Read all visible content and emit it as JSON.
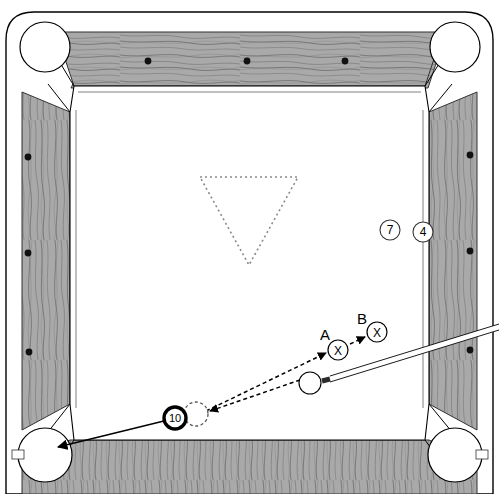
{
  "diagram": {
    "type": "pool-table-shot-diagram",
    "canvas": {
      "width": 499,
      "height": 494
    },
    "colors": {
      "cloth": "#ffffff",
      "rail_wood": "#a8a8a8",
      "rail_grain": "#5d5d5d",
      "outline": "#000000",
      "diamond": "#111111",
      "rack_outline": "#8a8a8a",
      "aim_line": "#111111",
      "cue_stick": "#ffffff",
      "cue_tip": "#2b2b2b"
    },
    "table": {
      "playfield": {
        "left": 52,
        "top": 33,
        "right": 446,
        "bottom": 470
      },
      "rail_width": 40,
      "diamonds": {
        "top": [
          148,
          247,
          345
        ],
        "left": [
          157,
          253,
          352
        ],
        "right": [
          155,
          251,
          350
        ],
        "count_per_rail": 3
      },
      "pockets": [
        {
          "name": "top-left",
          "cx": 45,
          "cy": 47,
          "r": 25
        },
        {
          "name": "top-right",
          "cx": 455,
          "cy": 47,
          "r": 25
        },
        {
          "name": "bottom-left",
          "cx": 45,
          "cy": 455,
          "r": 27
        },
        {
          "name": "bottom-right",
          "cx": 455,
          "cy": 455,
          "r": 27
        }
      ]
    },
    "rack": {
      "label": "rack-outline-triangle",
      "style": "dotted",
      "points": "200,177 298,177 249,265"
    },
    "balls": [
      {
        "id": "ball-7",
        "label": "7",
        "cx": 390,
        "cy": 230,
        "r": 10,
        "style": "thin-outline"
      },
      {
        "id": "ball-4",
        "label": "4",
        "cx": 423,
        "cy": 232,
        "r": 10,
        "style": "thin-outline"
      },
      {
        "id": "ball-10",
        "label": "10",
        "cx": 175,
        "cy": 418,
        "r": 11,
        "style": "thick-ring"
      },
      {
        "id": "cue-ball",
        "label": "",
        "cx": 310,
        "cy": 383,
        "r": 11,
        "style": "thin-outline"
      }
    ],
    "ghost_ball": {
      "id": "ghost-ball",
      "cx": 196,
      "cy": 414,
      "r": 12,
      "style": "dashed"
    },
    "targets": [
      {
        "id": "target-a",
        "letter": "A",
        "mark": "X",
        "cx": 338,
        "cy": 350,
        "r": 10,
        "letter_x": 325,
        "letter_y": 340
      },
      {
        "id": "target-b",
        "letter": "B",
        "mark": "X",
        "cx": 377,
        "cy": 332,
        "r": 10,
        "letter_x": 361,
        "letter_y": 324
      }
    ],
    "shot_lines": [
      {
        "id": "object-ball-path",
        "style": "solid",
        "from": [
          168,
          420
        ],
        "to": [
          56,
          448
        ],
        "arrow": true,
        "desc": "10-ball into bottom-left pocket"
      },
      {
        "id": "cue-ball-to-ghost",
        "style": "dashed",
        "from": [
          300,
          380
        ],
        "to": [
          208,
          412
        ],
        "arrow": true,
        "desc": "cue ball travels to ghost ball contact point"
      },
      {
        "id": "ghost-to-target-a",
        "style": "dashed",
        "from": [
          206,
          410
        ],
        "to": [
          327,
          352
        ],
        "arrow": true,
        "desc": "tangent / cue ball path toward A"
      },
      {
        "id": "target-a-to-b",
        "style": "dashed",
        "from": [
          350,
          344
        ],
        "to": [
          366,
          336
        ],
        "arrow": true,
        "desc": "A to B"
      }
    ],
    "cue_stick": {
      "id": "cue-stick",
      "tip": [
        322,
        381
      ],
      "butt": [
        499,
        327
      ],
      "width": 5,
      "tip_length": 14
    }
  }
}
